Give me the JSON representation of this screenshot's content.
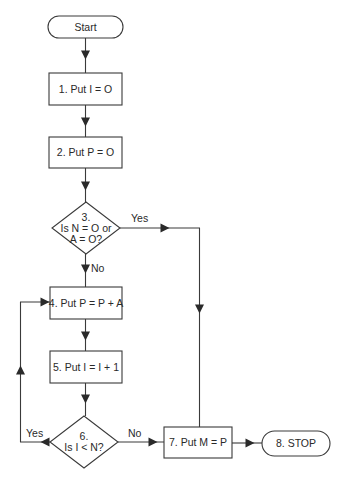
{
  "diagram": {
    "type": "flowchart",
    "colors": {
      "stroke": "#3a3a3a",
      "text": "#2a2a2a",
      "background": "#ffffff"
    },
    "nodes": [
      {
        "id": "start",
        "kind": "terminal",
        "lines": [
          "Start"
        ],
        "x": 48,
        "y": 16,
        "w": 75,
        "h": 22
      },
      {
        "id": "n1",
        "kind": "process",
        "lines": [
          "1. Put I = O"
        ],
        "x": 49,
        "y": 73,
        "w": 73,
        "h": 32
      },
      {
        "id": "n2",
        "kind": "process",
        "lines": [
          "2. Put P = O"
        ],
        "x": 49,
        "y": 137,
        "w": 73,
        "h": 31
      },
      {
        "id": "n3",
        "kind": "decision",
        "lines": [
          "3.",
          "Is N = O or",
          "A = O?"
        ],
        "cx": 86,
        "cy": 228,
        "rx": 34,
        "ry": 26
      },
      {
        "id": "n4",
        "kind": "process",
        "lines": [
          "4. Put P = P + A"
        ],
        "x": 50,
        "y": 287,
        "w": 72,
        "h": 32
      },
      {
        "id": "n5",
        "kind": "process",
        "lines": [
          "5. Put I = I + 1"
        ],
        "x": 50,
        "y": 351,
        "w": 72,
        "h": 32
      },
      {
        "id": "n6",
        "kind": "decision",
        "lines": [
          "6.",
          "Is I < N?"
        ],
        "cx": 84,
        "cy": 442,
        "rx": 34,
        "ry": 26
      },
      {
        "id": "n7",
        "kind": "process",
        "lines": [
          "7. Put M = P"
        ],
        "x": 164,
        "y": 427,
        "w": 68,
        "h": 31
      },
      {
        "id": "n8",
        "kind": "terminal",
        "lines": [
          "8. STOP"
        ],
        "x": 262,
        "y": 431,
        "w": 68,
        "h": 25
      }
    ],
    "edges": [
      {
        "from": "start",
        "to": "n1",
        "label": "",
        "points": [
          [
            85.5,
            38
          ],
          [
            85.5,
            73
          ]
        ],
        "arrow_at": [
          85.5,
          55
        ],
        "dir": "down"
      },
      {
        "from": "n1",
        "to": "n2",
        "label": "",
        "points": [
          [
            85.5,
            105
          ],
          [
            85.5,
            137
          ]
        ],
        "arrow_at": [
          85.5,
          122
        ],
        "dir": "down"
      },
      {
        "from": "n2",
        "to": "n3",
        "label": "",
        "points": [
          [
            85.5,
            168
          ],
          [
            85.5,
            202
          ]
        ],
        "arrow_at": [
          85.5,
          186
        ],
        "dir": "down"
      },
      {
        "from": "n3",
        "to": "n7",
        "label": "Yes",
        "label_pos": [
          131,
          222
        ],
        "points": [
          [
            120,
            228
          ],
          [
            199.5,
            228
          ],
          [
            199.5,
            427
          ]
        ],
        "arrow_at": [
          165,
          228
        ],
        "dir": "right",
        "arrow2_at": [
          199.5,
          309
        ],
        "dir2": "down"
      },
      {
        "from": "n3",
        "to": "n4",
        "label": "No",
        "label_pos": [
          91,
          272
        ],
        "points": [
          [
            85.5,
            254
          ],
          [
            85.5,
            287
          ]
        ],
        "arrow_at": [
          85.5,
          269
        ],
        "dir": "down"
      },
      {
        "from": "n4",
        "to": "n5",
        "label": "",
        "points": [
          [
            85.5,
            319
          ],
          [
            85.5,
            351
          ]
        ],
        "arrow_at": [
          85.5,
          336
        ],
        "dir": "down"
      },
      {
        "from": "n5",
        "to": "n6",
        "label": "",
        "points": [
          [
            85.5,
            383
          ],
          [
            85.5,
            416
          ]
        ],
        "arrow_at": [
          85.5,
          399
        ],
        "dir": "down"
      },
      {
        "from": "n6",
        "to": "n4",
        "label": "Yes",
        "label_pos": [
          26,
          437
        ],
        "points": [
          [
            50,
            442
          ],
          [
            20.5,
            442
          ],
          [
            20.5,
            302
          ],
          [
            50,
            302
          ]
        ],
        "arrow_at": [
          45,
          442
        ],
        "dir": "left",
        "arrow2_at": [
          20.5,
          370
        ],
        "dir2": "up",
        "arrow3_at": [
          45,
          302
        ],
        "dir3": "right"
      },
      {
        "from": "n6",
        "to": "n7",
        "label": "No",
        "label_pos": [
          128,
          437
        ],
        "points": [
          [
            118,
            442
          ],
          [
            164,
            442
          ]
        ],
        "arrow_at": [
          153,
          442
        ],
        "dir": "right"
      },
      {
        "from": "n7",
        "to": "n8",
        "label": "",
        "points": [
          [
            232,
            443
          ],
          [
            262,
            443
          ]
        ],
        "arrow_at": [
          250,
          443
        ],
        "dir": "right"
      }
    ]
  }
}
